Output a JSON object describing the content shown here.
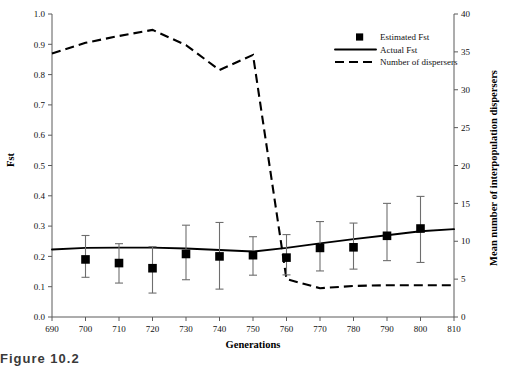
{
  "chart_data": {
    "type": "line",
    "title": "",
    "xlabel": "Generations",
    "ylabel": "Fst",
    "y2label": "Mean number of interpopulation dispersers",
    "xlim": [
      690,
      810
    ],
    "ylim": [
      0.0,
      1.0
    ],
    "y2lim": [
      0,
      40
    ],
    "xticks": [
      690,
      700,
      710,
      720,
      730,
      740,
      750,
      760,
      770,
      780,
      790,
      800,
      810
    ],
    "yticks": [
      "0.0",
      "0.1",
      "0.2",
      "0.3",
      "0.4",
      "0.5",
      "0.6",
      "0.7",
      "0.8",
      "0.9",
      "1.0"
    ],
    "y2ticks": [
      0,
      5,
      10,
      15,
      20,
      25,
      30,
      35,
      40
    ],
    "grid": false,
    "legend_position": "top-right",
    "series": [
      {
        "name": "Estimated Fst",
        "type": "scatter-errorbar",
        "axis": "left",
        "marker": "square",
        "x": [
          700,
          710,
          720,
          730,
          740,
          750,
          760,
          770,
          780,
          790,
          800
        ],
        "values": [
          0.19,
          0.178,
          0.161,
          0.208,
          0.2,
          0.204,
          0.196,
          0.228,
          0.23,
          0.268,
          0.292
        ],
        "err_low": [
          0.131,
          0.112,
          0.079,
          0.123,
          0.092,
          0.138,
          0.139,
          0.152,
          0.158,
          0.186,
          0.18
        ],
        "err_high": [
          0.269,
          0.242,
          0.232,
          0.303,
          0.312,
          0.265,
          0.272,
          0.315,
          0.31,
          0.375,
          0.398
        ]
      },
      {
        "name": "Actual Fst",
        "type": "line",
        "axis": "left",
        "style": "solid",
        "x": [
          690,
          700,
          710,
          720,
          730,
          740,
          750,
          760,
          770,
          780,
          790,
          800,
          810
        ],
        "values": [
          0.223,
          0.228,
          0.229,
          0.229,
          0.226,
          0.221,
          0.216,
          0.228,
          0.243,
          0.257,
          0.27,
          0.283,
          0.29
        ]
      },
      {
        "name": "Number of dispersers",
        "type": "line",
        "axis": "right",
        "style": "dashed",
        "x": [
          690,
          700,
          710,
          720,
          730,
          740,
          750,
          760,
          770,
          780,
          790,
          800,
          810
        ],
        "values": [
          34.8,
          36.2,
          37.1,
          37.9,
          35.9,
          32.6,
          34.6,
          5.0,
          3.8,
          4.1,
          4.2,
          4.2,
          4.2
        ]
      }
    ],
    "legend": [
      {
        "label": "Estimated Fst",
        "marker": "square"
      },
      {
        "label": "Actual Fst",
        "marker": "solid-line"
      },
      {
        "label": "Number of dispersers",
        "marker": "dashed-line"
      }
    ]
  },
  "caption": {
    "text": "Figure 10.2"
  }
}
